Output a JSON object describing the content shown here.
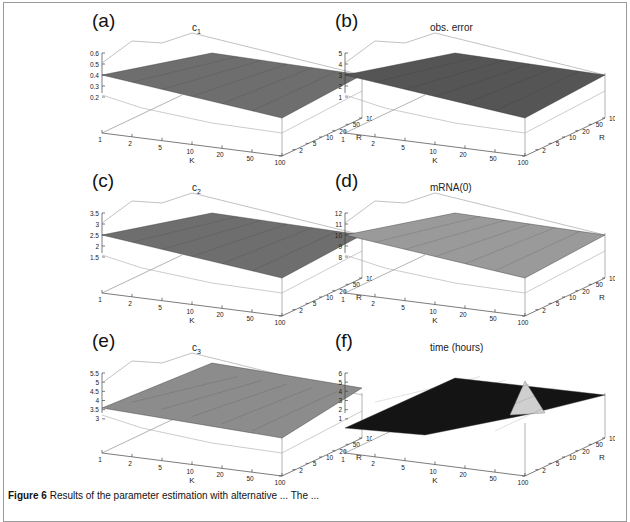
{
  "figure": {
    "caption_label": "Figure 6",
    "caption_text": "Results of the parameter estimation with alternative ... The ..."
  },
  "panels": [
    {
      "letter": "(a)",
      "title": "c",
      "title_sub": "1",
      "zticks": [
        "0.6",
        "0.5",
        "0.4",
        "0.3",
        "0.2"
      ],
      "surface": "#6e6e6e"
    },
    {
      "letter": "(b)",
      "title": "obs. error",
      "title_sub": "",
      "zticks": [
        "5",
        "4",
        "3",
        "2",
        "1"
      ],
      "surface": "#555555"
    },
    {
      "letter": "(c)",
      "title": "c",
      "title_sub": "2",
      "zticks": [
        "3.5",
        "3",
        "2.5",
        "2",
        "1.5"
      ],
      "surface": "#6e6e6e"
    },
    {
      "letter": "(d)",
      "title": "mRNA(0)",
      "title_sub": "",
      "zticks": [
        "12",
        "11",
        "10",
        "9",
        "8"
      ],
      "surface": "#9a9a9a"
    },
    {
      "letter": "(e)",
      "title": "c",
      "title_sub": "3",
      "zticks": [
        "5.5",
        "5",
        "4.5",
        "4",
        "3.5",
        "3"
      ],
      "surface": "#8c8c8c"
    },
    {
      "letter": "(f)",
      "title": "time (hours)",
      "title_sub": "",
      "zticks": [
        "6",
        "5",
        "4",
        "3",
        "2",
        "1"
      ],
      "surface": "#141414"
    }
  ],
  "axes": {
    "k_label": "K",
    "r_label": "R",
    "k_ticks": [
      "1",
      "2",
      "5",
      "10",
      "20",
      "50",
      "100"
    ],
    "r_ticks": [
      "1",
      "2",
      "5",
      "10",
      "20",
      "50",
      "100"
    ]
  },
  "chart_data": [
    {
      "type": "surface3d",
      "title": "c1",
      "xlabel": "K",
      "ylabel": "R",
      "x": [
        1,
        2,
        5,
        10,
        20,
        50,
        100
      ],
      "y": [
        1,
        2,
        5,
        10,
        20,
        50,
        100
      ],
      "zlim": [
        0.1,
        0.6
      ],
      "zticks": [
        0.2,
        0.3,
        0.4,
        0.5,
        0.6
      ],
      "description": "Mean surface ~0.4 at low K/R, flattening to ~0.4 at high K/R; wireframe bounds spread 0.25-0.6 at low K, converging at high K"
    },
    {
      "type": "surface3d",
      "title": "obs. error",
      "xlabel": "K",
      "ylabel": "R",
      "x": [
        1,
        2,
        5,
        10,
        20,
        50,
        100
      ],
      "y": [
        1,
        2,
        5,
        10,
        20,
        50,
        100
      ],
      "zlim": [
        0,
        5
      ],
      "zticks": [
        1,
        2,
        3,
        4,
        5
      ],
      "description": "Mean surface ~3 across grid; wireframe bounds 1-5 at low K, converging at high K"
    },
    {
      "type": "surface3d",
      "title": "c2",
      "xlabel": "K",
      "ylabel": "R",
      "x": [
        1,
        2,
        5,
        10,
        20,
        50,
        100
      ],
      "y": [
        1,
        2,
        5,
        10,
        20,
        50,
        100
      ],
      "zlim": [
        1,
        3.5
      ],
      "zticks": [
        1.5,
        2,
        2.5,
        3,
        3.5
      ],
      "description": "Mean surface ~2.4 across grid; bounds 1.7-3.3 at low K"
    },
    {
      "type": "surface3d",
      "title": "mRNA(0)",
      "xlabel": "K",
      "ylabel": "R",
      "x": [
        1,
        2,
        5,
        10,
        20,
        50,
        100
      ],
      "y": [
        1,
        2,
        5,
        10,
        20,
        50,
        100
      ],
      "zlim": [
        7.5,
        12
      ],
      "zticks": [
        8,
        9,
        10,
        11,
        12
      ],
      "description": "Mean surface ~10 across grid; bounds 8-12"
    },
    {
      "type": "surface3d",
      "title": "c3",
      "xlabel": "K",
      "ylabel": "R",
      "x": [
        1,
        2,
        5,
        10,
        20,
        50,
        100
      ],
      "y": [
        1,
        2,
        5,
        10,
        20,
        50,
        100
      ],
      "zlim": [
        2.5,
        5.5
      ],
      "zticks": [
        3,
        3.5,
        4,
        4.5,
        5,
        5.5
      ],
      "description": "Mean surface ~3.7 at low K rising to ~4.8 at high R; bounds 3-5.5"
    },
    {
      "type": "surface3d",
      "title": "time (hours)",
      "xlabel": "K",
      "ylabel": "R",
      "x": [
        1,
        2,
        5,
        10,
        20,
        50,
        100
      ],
      "y": [
        1,
        2,
        5,
        10,
        20,
        50,
        100
      ],
      "zlim": [
        0,
        6
      ],
      "zticks": [
        1,
        2,
        3,
        4,
        5,
        6
      ],
      "description": "Computation time near 0 at K=1,R=1, rising to ~5 at K=1,R=100 and ~3 at K=100,R=100, with peak ~3 near K=100,R=1"
    }
  ]
}
